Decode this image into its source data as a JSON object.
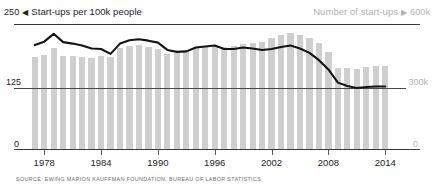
{
  "header": {
    "left_axis_max": "250",
    "left_marker": "◀",
    "left_label": "Start-ups per 100k people",
    "right_label": "Number of start-ups",
    "right_marker": "▶",
    "right_axis_max": "600k"
  },
  "axes": {
    "left_mid": "125",
    "left_zero": "0",
    "right_mid": "300k",
    "right_zero": "0"
  },
  "source": "SOURCE: EWING MARION KAUFFMAN FOUNDATION, BUREAU OF LABOR STATISTICS",
  "colors": {
    "bar": "#cfcfcf",
    "line": "#141414",
    "rule": "#3a3a3a",
    "dim_text": "#b0b0b0",
    "text": "#222222"
  },
  "chart_data": {
    "type": "bar",
    "title": "",
    "subtitle": "",
    "xlabel": "",
    "ylabel": "Start-ups per 100k people",
    "y2label": "Number of start-ups",
    "ylim": [
      0,
      250
    ],
    "y2lim": [
      0,
      600000
    ],
    "grid": true,
    "legend_position": "top",
    "x": [
      1977,
      1978,
      1979,
      1980,
      1981,
      1982,
      1983,
      1984,
      1985,
      1986,
      1987,
      1988,
      1989,
      1990,
      1991,
      1992,
      1993,
      1994,
      1995,
      1996,
      1997,
      1998,
      1999,
      2000,
      2001,
      2002,
      2003,
      2004,
      2005,
      2006,
      2007,
      2008,
      2009,
      2010,
      2011,
      2012,
      2013,
      2014
    ],
    "xticks": [
      1978,
      1984,
      1990,
      1996,
      2002,
      2008,
      2014
    ],
    "xticklabels": [
      "1978",
      "1984",
      "1990",
      "1996",
      "2002",
      "2008",
      "2014"
    ],
    "yticks": [
      0,
      125,
      250
    ],
    "yticklabels": [
      "0",
      "125",
      "250"
    ],
    "y2ticks": [
      0,
      300000,
      600000
    ],
    "y2ticklabels": [
      "0",
      "300k",
      "600k"
    ],
    "series": [
      {
        "name": "Number of start-ups",
        "type": "bar",
        "axis": "right",
        "color": "#cfcfcf",
        "units": "start-ups",
        "values": [
          452000,
          462000,
          495000,
          455000,
          455000,
          452000,
          450000,
          455000,
          452000,
          498000,
          505000,
          512000,
          500000,
          492000,
          468000,
          470000,
          480000,
          498000,
          505000,
          512000,
          500000,
          505000,
          518000,
          522000,
          528000,
          545000,
          562000,
          570000,
          562000,
          548000,
          520000,
          478000,
          400000,
          398000,
          395000,
          405000,
          408000,
          408000
        ]
      },
      {
        "name": "Start-ups per 100k people",
        "type": "line",
        "axis": "left",
        "color": "#141414",
        "units": "per 100k people",
        "values": [
          213,
          220,
          236,
          219,
          216,
          212,
          206,
          205,
          195,
          216,
          223,
          225,
          222,
          218,
          203,
          199,
          200,
          208,
          210,
          212,
          205,
          205,
          208,
          206,
          203,
          205,
          209,
          212,
          206,
          197,
          182,
          163,
          136,
          129,
          125,
          127,
          128,
          128
        ]
      }
    ]
  }
}
